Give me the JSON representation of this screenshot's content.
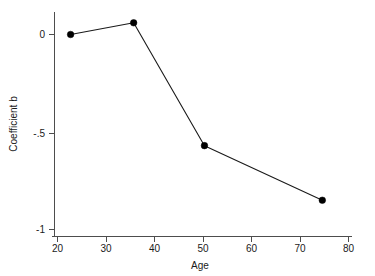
{
  "chart_data": {
    "type": "line",
    "title": "",
    "xlabel": "Age",
    "ylabel": "Coefficient b",
    "xlim": [
      18,
      82
    ],
    "ylim": [
      -1.08,
      0.12
    ],
    "xticks": [
      20,
      30,
      40,
      50,
      60,
      70,
      80
    ],
    "xticklabels": [
      "20",
      "30",
      "40",
      "50",
      "60",
      "70",
      "80"
    ],
    "yticks": [
      0,
      -0.5,
      -1
    ],
    "yticklabels": [
      "0",
      "-.5",
      "-1"
    ],
    "grid": false,
    "legend": null,
    "marker": "filled-circle",
    "series": [
      {
        "name": "Coefficient b",
        "x": [
          22.7,
          35.7,
          50.3,
          74.6
        ],
        "values": [
          0.0,
          0.06,
          -0.57,
          -0.85
        ],
        "points": [
          {
            "x": 22.7,
            "y": 0.0
          },
          {
            "x": 35.7,
            "y": 0.06
          },
          {
            "x": 50.3,
            "y": -0.57
          },
          {
            "x": 74.6,
            "y": -0.85
          }
        ]
      }
    ],
    "colors": {
      "line": "#1a1a1a",
      "marker": "#000000",
      "axis": "#4d4d4d",
      "text": "#1a1a1a",
      "background": "#ffffff"
    }
  },
  "axes": {
    "x_title": "Age",
    "y_title": "Coefficient b",
    "x_tick_0": "20",
    "x_tick_1": "30",
    "x_tick_2": "40",
    "x_tick_3": "50",
    "x_tick_4": "60",
    "x_tick_5": "70",
    "x_tick_6": "80",
    "y_tick_0": "0",
    "y_tick_1": "-.5",
    "y_tick_2": "-1"
  }
}
